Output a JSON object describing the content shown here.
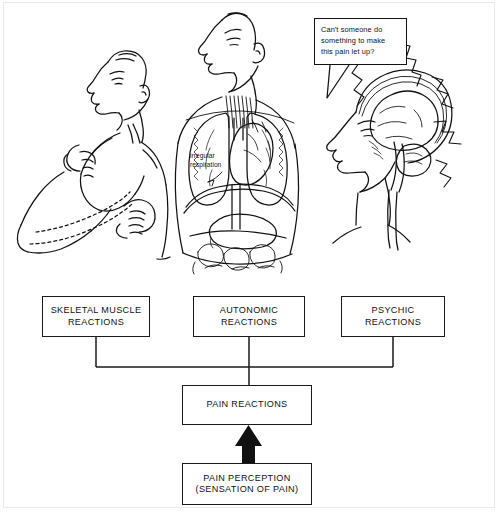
{
  "figure": {
    "speech_bubble": {
      "text": "Can't someone do\nsomething to make\nthis pain let up?"
    },
    "annotations": [
      {
        "name": "irregular-respiration",
        "text": "irregular\nrespiration"
      }
    ],
    "illustrations": [
      {
        "name": "tense-man-clenched-fists",
        "depicts": "man with head tilted back and clenched fists"
      },
      {
        "name": "torso-anatomy",
        "depicts": "torso with lungs, heart, diaphragm, stomach and intestines"
      },
      {
        "name": "head-brain-profile",
        "depicts": "head in profile showing brain, brainstem and spinal cord with radiating pain lines"
      }
    ]
  },
  "flowchart": {
    "type": "diagram",
    "nodes": [
      {
        "id": "skeletal",
        "label": "SKELETAL MUSCLE\nREACTIONS"
      },
      {
        "id": "autonomic",
        "label": "AUTONOMIC\nREACTIONS"
      },
      {
        "id": "psychic",
        "label": "PSYCHIC\nREACTIONS"
      },
      {
        "id": "pain_reactions",
        "label": "PAIN REACTIONS"
      },
      {
        "id": "pain_perception",
        "label": "PAIN PERCEPTION\n(SENSATION OF PAIN)"
      }
    ],
    "edges": [
      {
        "from": "pain_perception",
        "to": "pain_reactions",
        "style": "thick-arrow-up"
      },
      {
        "from": "pain_reactions",
        "to": "skeletal",
        "style": "plain-line"
      },
      {
        "from": "pain_reactions",
        "to": "autonomic",
        "style": "plain-line"
      },
      {
        "from": "pain_reactions",
        "to": "psychic",
        "style": "plain-line"
      }
    ],
    "colors": {
      "line": "#1a1a1a",
      "background": "#ffffff"
    }
  }
}
